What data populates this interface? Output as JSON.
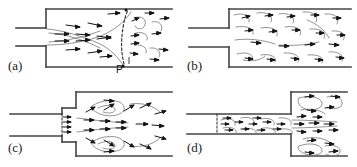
{
  "figure": {
    "kind": "flow-visualization-diagram",
    "background_color": "#ffffff",
    "line_color": "#3a3a3a",
    "wall_color": "#444444",
    "arrow_color": "#1a1a1a",
    "streamline_color": "#777777",
    "width_px": 357,
    "height_px": 167,
    "panel_count": 4
  },
  "panels": [
    {
      "id": "a",
      "label": "(a)",
      "caption_point": "P",
      "geometry": "sudden-expansion",
      "description": "Laminar jet issuing from small inlet duct into larger duct, with bounding streamlines spreading downstream and a vena-contracta style terminating front",
      "flow_direction": "left-to-right",
      "annotations": [
        {
          "text": "P",
          "x": 116,
          "y": 64,
          "meaning": "reattachment-point"
        }
      ]
    },
    {
      "id": "b",
      "label": "(b)",
      "geometry": "sudden-expansion",
      "description": "Turbulent flow downstream of sudden expansion filling the enlarged duct with irregular eddies",
      "flow_direction": "left-to-right"
    },
    {
      "id": "c",
      "label": "(c)",
      "geometry": "slot-orifice-into-chamber",
      "description": "Flow issuing through a narrow short slot into a large chamber, with recirculation vortices above and below the central jet",
      "flow_direction": "left-to-right"
    },
    {
      "id": "d",
      "label": "(d)",
      "geometry": "pipe-jet-into-chamber",
      "description": "Turbulent pipe flow discharging as a jet into a large chamber, with recirculating eddies in the upper and lower corners",
      "flow_direction": "left-to-right"
    }
  ]
}
